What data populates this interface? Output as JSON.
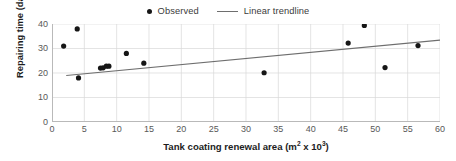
{
  "chart_data": {
    "type": "scatter",
    "title": "",
    "xlabel": "Tank coating renewal area (m² x 10³)",
    "xlabel_base": "Tank coating renewal area (m",
    "xlabel_sup1": "2",
    "xlabel_mid": " x 10",
    "xlabel_sup2": "3",
    "xlabel_end": ")",
    "ylabel": "Repairing time (day)",
    "xlim": [
      0,
      60
    ],
    "ylim": [
      0,
      40
    ],
    "xticks": [
      0,
      5,
      10,
      15,
      20,
      25,
      30,
      35,
      40,
      45,
      50,
      55,
      60
    ],
    "yticks": [
      0,
      10,
      20,
      30,
      40
    ],
    "grid": true,
    "grid_color": "#d9d9d9",
    "legend_position": "top-center",
    "series": [
      {
        "name": "Observed",
        "type": "scatter",
        "marker": "circle",
        "color": "#161616",
        "points": [
          {
            "x": 1.8,
            "y": 31.0
          },
          {
            "x": 3.9,
            "y": 38.0
          },
          {
            "x": 4.1,
            "y": 18.0
          },
          {
            "x": 7.5,
            "y": 22.0
          },
          {
            "x": 7.9,
            "y": 22.1
          },
          {
            "x": 8.4,
            "y": 22.8
          },
          {
            "x": 8.8,
            "y": 22.8
          },
          {
            "x": 11.5,
            "y": 28.0
          },
          {
            "x": 14.2,
            "y": 24.0
          },
          {
            "x": 32.8,
            "y": 20.1
          },
          {
            "x": 45.8,
            "y": 32.2
          },
          {
            "x": 48.3,
            "y": 39.4
          },
          {
            "x": 51.5,
            "y": 22.2
          },
          {
            "x": 56.6,
            "y": 31.2
          }
        ]
      },
      {
        "name": "Linear trendline",
        "type": "line",
        "color": "#6e6e6e",
        "endpoints": [
          {
            "x": 2.2,
            "y": 19.0
          },
          {
            "x": 60.0,
            "y": 33.4
          }
        ]
      }
    ],
    "legend": [
      {
        "label": "Observed",
        "marker": "dot",
        "color": "#161616"
      },
      {
        "label": "Linear trendline",
        "marker": "line",
        "color": "#6e6e6e"
      }
    ]
  }
}
